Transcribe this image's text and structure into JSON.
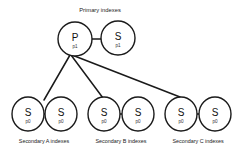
{
  "diagram": {
    "title": "Primary indexes",
    "title_pos": {
      "x": 100,
      "y": 10
    },
    "nodes": [
      {
        "id": "p-node",
        "letter": "P",
        "sublabel": "p1",
        "cx": 75,
        "cy": 39,
        "rx": 17,
        "ry": 17
      },
      {
        "id": "s-top",
        "letter": "S",
        "sublabel": "p1",
        "cx": 118,
        "cy": 38,
        "rx": 17,
        "ry": 17
      },
      {
        "id": "s-a1",
        "letter": "S",
        "sublabel": "p0",
        "cx": 28,
        "cy": 114,
        "rx": 16,
        "ry": 17
      },
      {
        "id": "s-a2",
        "letter": "S",
        "sublabel": "p0",
        "cx": 61,
        "cy": 114,
        "rx": 16,
        "ry": 17
      },
      {
        "id": "s-b1",
        "letter": "S",
        "sublabel": "p0",
        "cx": 104,
        "cy": 114,
        "rx": 16,
        "ry": 17
      },
      {
        "id": "s-b2",
        "letter": "S",
        "sublabel": "p0",
        "cx": 138,
        "cy": 114,
        "rx": 16,
        "ry": 17
      },
      {
        "id": "s-c1",
        "letter": "S",
        "sublabel": "p0",
        "cx": 181,
        "cy": 114,
        "rx": 16,
        "ry": 17
      },
      {
        "id": "s-c2",
        "letter": "S",
        "sublabel": "p0",
        "cx": 215,
        "cy": 114,
        "rx": 16,
        "ry": 17
      }
    ],
    "edges": [
      {
        "id": "edge-p-to-stop",
        "x1": 92,
        "y1": 39,
        "x2": 101,
        "y2": 39
      },
      {
        "id": "edge-p-to-a",
        "x1": 70,
        "y1": 55,
        "x2": 44,
        "y2": 100
      },
      {
        "id": "edge-p-to-b",
        "x1": 71,
        "y1": 55,
        "x2": 103,
        "y2": 98
      },
      {
        "id": "edge-p-to-c",
        "x1": 72,
        "y1": 55,
        "x2": 180,
        "y2": 97
      },
      {
        "id": "edge-a1-a2",
        "x1": 44,
        "y1": 114,
        "x2": 45,
        "y2": 114
      },
      {
        "id": "edge-b1-b2",
        "x1": 120,
        "y1": 114,
        "x2": 122,
        "y2": 114
      },
      {
        "id": "edge-c1-c2",
        "x1": 197,
        "y1": 114,
        "x2": 199,
        "y2": 114
      }
    ],
    "captions": [
      {
        "id": "caption-a",
        "text": "Secondary A indexes",
        "x": 44,
        "y": 142
      },
      {
        "id": "caption-b",
        "text": "Secondary B indexes",
        "x": 121,
        "y": 142
      },
      {
        "id": "caption-c",
        "text": "Secondary C indexes",
        "x": 198,
        "y": 142
      }
    ],
    "colors": {
      "stroke": "#1a1a1a",
      "fill": "#ffffff",
      "background": "#ffffff",
      "text": "#111111"
    }
  }
}
